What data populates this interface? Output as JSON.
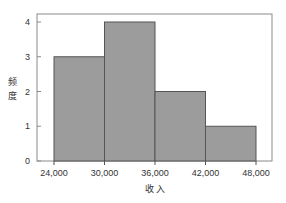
{
  "chart_data": {
    "type": "bar",
    "subtype": "histogram",
    "title": "",
    "xlabel": "收 入",
    "ylabel": "频度",
    "bins": [
      {
        "from": 24000,
        "to": 30000,
        "count": 3
      },
      {
        "from": 30000,
        "to": 36000,
        "count": 4
      },
      {
        "from": 36000,
        "to": 42000,
        "count": 2
      },
      {
        "from": 42000,
        "to": 48000,
        "count": 1
      }
    ],
    "categories": [
      "24,000-30,000",
      "30,000-36,000",
      "36,000-42,000",
      "42,000-48,000"
    ],
    "values": [
      3,
      4,
      2,
      1
    ],
    "x_ticks": [
      "24,000",
      "30,000",
      "36,000",
      "42,000",
      "48,000"
    ],
    "y_ticks": [
      "0",
      "1",
      "2",
      "3",
      "4"
    ],
    "xlim": [
      24000,
      48000
    ],
    "ylim": [
      0,
      4
    ],
    "grid": false,
    "legend": null,
    "colors": {
      "bar_fill": "#9c9c9c",
      "bar_edge": "#555555",
      "frame": "#8a8a8a"
    }
  }
}
